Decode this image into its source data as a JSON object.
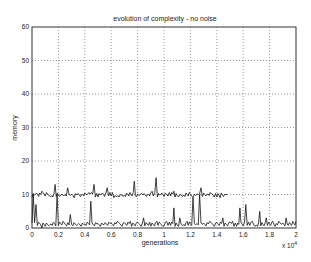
{
  "chart_data": {
    "type": "line",
    "title": "evolution of complexity - no noise",
    "xlabel": "generations",
    "ylabel": "memory",
    "x_multiplier": "x 10^4",
    "xlim": [
      0,
      2
    ],
    "ylim": [
      0,
      60
    ],
    "x_ticks": [
      "0",
      "0.2",
      "0.4",
      "0.6",
      "0.8",
      "1",
      "1.2",
      "1.4",
      "1.6",
      "1.8",
      "2"
    ],
    "y_ticks": [
      "0",
      "10",
      "20",
      "30",
      "40",
      "50",
      "60"
    ],
    "grid": true,
    "series": [
      {
        "name": "upper trace (~10, ends ~1.5e4)",
        "x": [
          0,
          0.05,
          0.1,
          0.15,
          0.2,
          0.25,
          0.3,
          0.35,
          0.4,
          0.45,
          0.5,
          0.55,
          0.6,
          0.65,
          0.7,
          0.75,
          0.8,
          0.85,
          0.9,
          0.93,
          0.95,
          1.0,
          1.05,
          1.1,
          1.15,
          1.2,
          1.25,
          1.27,
          1.3,
          1.35,
          1.4,
          1.45,
          1.48
        ],
        "y": [
          10,
          11,
          10,
          13,
          10,
          12,
          9,
          10,
          10,
          13,
          10,
          12,
          9,
          10,
          10,
          14,
          10,
          10,
          11,
          15,
          10,
          10,
          11,
          10,
          10,
          9,
          10,
          12,
          10,
          10,
          9,
          10,
          10
        ]
      },
      {
        "name": "lower trace (~0-7)",
        "x": [
          0,
          0.02,
          0.05,
          0.1,
          0.18,
          0.2,
          0.28,
          0.3,
          0.4,
          0.5,
          0.6,
          0.7,
          0.8,
          0.9,
          1.0,
          1.05,
          1.1,
          1.15,
          1.2,
          1.25,
          1.3,
          1.4,
          1.5,
          1.55,
          1.6,
          1.65,
          1.7,
          1.75,
          1.8,
          1.85,
          1.9,
          1.95,
          2.0
        ],
        "y": [
          10,
          7,
          0,
          1,
          10,
          2,
          4,
          1,
          8,
          1,
          2,
          2,
          3,
          2,
          2,
          6,
          3,
          2,
          9,
          10,
          2,
          3,
          2,
          6,
          7,
          2,
          5,
          3,
          2,
          2,
          3,
          2,
          2
        ]
      }
    ]
  }
}
